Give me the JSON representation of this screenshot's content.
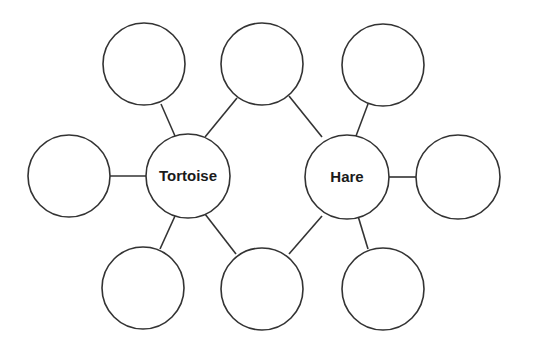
{
  "diagram": {
    "type": "double-bubble-map",
    "center_nodes": [
      {
        "id": "tortoise",
        "label": "Tortoise",
        "cx": 188,
        "cy": 176,
        "r": 42
      },
      {
        "id": "hare",
        "label": "Hare",
        "cx": 347,
        "cy": 177,
        "r": 42
      }
    ],
    "empty_nodes": [
      {
        "id": "tortoise-top",
        "cx": 144,
        "cy": 64,
        "r": 41
      },
      {
        "id": "shared-top",
        "cx": 262,
        "cy": 64,
        "r": 41
      },
      {
        "id": "hare-top",
        "cx": 383,
        "cy": 65,
        "r": 41
      },
      {
        "id": "tortoise-left",
        "cx": 69,
        "cy": 176,
        "r": 41
      },
      {
        "id": "hare-right",
        "cx": 458,
        "cy": 177,
        "r": 42
      },
      {
        "id": "tortoise-bottom",
        "cx": 143,
        "cy": 288,
        "r": 41
      },
      {
        "id": "shared-bottom",
        "cx": 262,
        "cy": 289,
        "r": 41
      },
      {
        "id": "hare-bottom",
        "cx": 383,
        "cy": 289,
        "r": 41
      }
    ],
    "stroke_color": "#333333",
    "background": "#ffffff"
  }
}
